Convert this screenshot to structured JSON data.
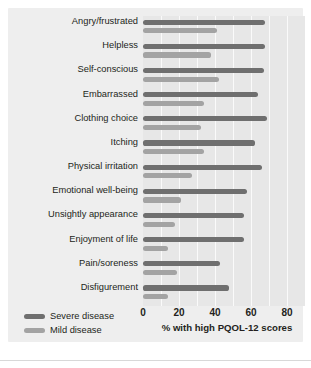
{
  "chart_data": {
    "type": "bar",
    "orientation": "horizontal",
    "title": "",
    "xlabel": "% with high PQOL-12 scores",
    "ylabel": "",
    "xlim": [
      0,
      90
    ],
    "xticks": [
      0,
      20,
      40,
      60,
      80
    ],
    "xtick_labels": [
      "0",
      "20",
      "40",
      "60",
      "80"
    ],
    "gridlines": [
      10,
      20,
      30,
      40,
      50,
      60,
      70,
      80
    ],
    "grid": true,
    "legend_position": "bottom-left",
    "categories": [
      "Angry/frustrated",
      "Helpless",
      "Self-conscious",
      "Embarrassed",
      "Clothing choice",
      "Itching",
      "Physical irritation",
      "Emotional well-being",
      "Unsightly appearance",
      "Enjoyment of life",
      "Pain/soreness",
      "Disfigurement"
    ],
    "series": [
      {
        "name": "Severe disease",
        "color": "#6f6f6f",
        "values": [
          68,
          68,
          67,
          64,
          69,
          62,
          66,
          58,
          56,
          56,
          43,
          48
        ]
      },
      {
        "name": "Mild disease",
        "color": "#a3a3a3",
        "values": [
          41,
          38,
          42,
          34,
          32,
          34,
          27,
          21,
          18,
          14,
          19,
          14
        ]
      }
    ]
  },
  "legend": {
    "items": [
      {
        "label": "Severe disease",
        "color": "#6f6f6f"
      },
      {
        "label": "Mild disease",
        "color": "#a3a3a3"
      }
    ]
  },
  "axis": {
    "title": "% with high PQOL-12 scores"
  }
}
